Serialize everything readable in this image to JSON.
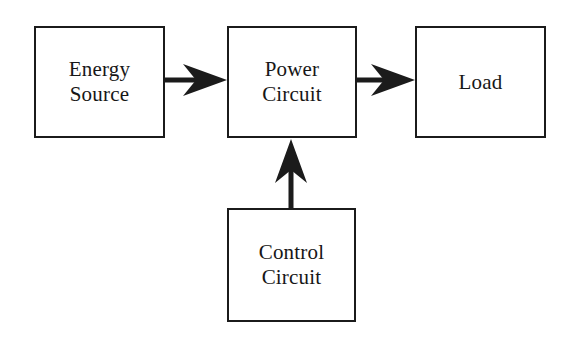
{
  "diagram": {
    "type": "block-diagram",
    "canvas": {
      "width": 567,
      "height": 339
    },
    "style": {
      "background_color": "#ffffff",
      "line_color": "#1b1b1b",
      "text_color": "#171717",
      "border_width_px": 2
    },
    "blocks": [
      {
        "id": "energy-source",
        "label": "Energy Source",
        "lines": [
          "Energy",
          "Source"
        ],
        "x": 34,
        "y": 26,
        "width": 131,
        "height": 112
      },
      {
        "id": "power-circuit",
        "label": "Power Circuit",
        "lines": [
          "Power",
          "Circuit"
        ],
        "x": 227,
        "y": 26,
        "width": 130,
        "height": 112
      },
      {
        "id": "load",
        "label": "Load",
        "lines": [
          "Load"
        ],
        "x": 415,
        "y": 26,
        "width": 131,
        "height": 112
      },
      {
        "id": "control-circuit",
        "label": "Control Circuit",
        "lines": [
          "Control",
          "Circuit"
        ],
        "x": 227,
        "y": 208,
        "width": 129,
        "height": 114
      }
    ],
    "connectors": [
      {
        "id": "energy-source-to-power-circuit",
        "from": "energy-source",
        "to": "power-circuit",
        "direction": "right",
        "label": "",
        "tail_x": 165,
        "tail_y": 80,
        "head_x": 227,
        "head_y": 80
      },
      {
        "id": "power-circuit-to-load",
        "from": "power-circuit",
        "to": "load",
        "direction": "right",
        "label": "",
        "tail_x": 357,
        "tail_y": 80,
        "head_x": 415,
        "head_y": 80
      },
      {
        "id": "control-circuit-to-power-circuit",
        "from": "control-circuit",
        "to": "power-circuit",
        "direction": "up",
        "label": "",
        "tail_x": 291,
        "tail_y": 208,
        "head_x": 291,
        "head_y": 139
      }
    ]
  }
}
